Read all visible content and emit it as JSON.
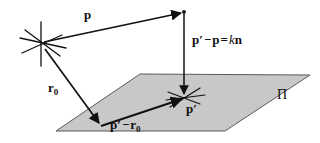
{
  "figure": {
    "type": "geometry-vector-diagram",
    "width": 320,
    "height": 143,
    "background_color": "#ffffff",
    "stroke_color": "#111111",
    "plane_fill_color": "#c8c8c8",
    "plane_edge_color": "#555555"
  },
  "labels": {
    "p": {
      "text": "p",
      "name": "vector-p-label"
    },
    "pp_minus_p": {
      "lhs_p_prime": "p",
      "prime": "′",
      "minus": "−",
      "p": "p",
      "equals": "=",
      "k": "k",
      "n": "n",
      "full_text": "p′ − p = kn"
    },
    "r0": {
      "symbol": "r",
      "subscript": "0",
      "full_text": "r₀"
    },
    "pp_minus_r0": {
      "p": "p",
      "prime": "′",
      "minus": "−",
      "r": "r",
      "subscript": "0",
      "full_text": "p′ − r₀"
    },
    "p_prime": {
      "symbol": "p",
      "prime": "′",
      "full_text": "p′"
    },
    "plane": {
      "text": "Π",
      "name": "plane-pi-label"
    }
  },
  "geometry": {
    "origin_point": {
      "x": 41,
      "y": 44
    },
    "point_p": {
      "x": 184,
      "y": 12
    },
    "point_p_prime": {
      "x": 184,
      "y": 97
    },
    "point_r0_tip": {
      "x": 100,
      "y": 125
    },
    "plane_corners": [
      {
        "x": 56,
        "y": 131
      },
      {
        "x": 140,
        "y": 74
      },
      {
        "x": 310,
        "y": 75
      },
      {
        "x": 225,
        "y": 131
      }
    ]
  }
}
